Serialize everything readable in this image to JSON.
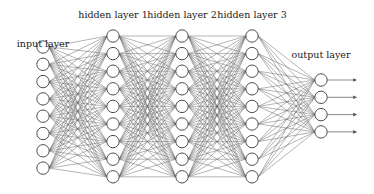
{
  "diagram": {
    "type": "feedforward-neural-network",
    "colors": {
      "edge": "#6b6b6b",
      "node_stroke": "#3a3a3a",
      "node_fill": "#ffffff",
      "arrow": "#555555"
    },
    "layers": [
      {
        "label": "input layer",
        "x": 43,
        "label_y": 45,
        "nodes": 8,
        "y_start": 47,
        "spacing": 17.3
      },
      {
        "label": "hidden layer 1",
        "x": 113,
        "label_y": 16,
        "nodes": 9,
        "y_start": 36,
        "spacing": 17.6
      },
      {
        "label": "hidden layer 2",
        "x": 182,
        "label_y": 16,
        "nodes": 9,
        "y_start": 36,
        "spacing": 17.6
      },
      {
        "label": "hidden layer 3",
        "x": 252,
        "label_y": 16,
        "nodes": 9,
        "y_start": 36,
        "spacing": 17.6
      },
      {
        "label": "output layer",
        "x": 321,
        "label_y": 56,
        "nodes": 4,
        "y_start": 80,
        "spacing": 17.3
      }
    ],
    "node_radius": 6.2,
    "output_arrow_length": 30
  }
}
